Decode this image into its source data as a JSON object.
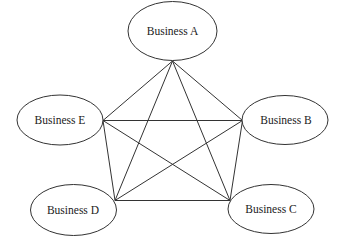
{
  "diagram": {
    "type": "network",
    "nodes": [
      {
        "id": "A",
        "label": "Business A"
      },
      {
        "id": "B",
        "label": "Business B"
      },
      {
        "id": "C",
        "label": "Business C"
      },
      {
        "id": "D",
        "label": "Business D"
      },
      {
        "id": "E",
        "label": "Business E"
      }
    ],
    "edges": [
      [
        "A",
        "E"
      ],
      [
        "A",
        "B"
      ],
      [
        "A",
        "D"
      ],
      [
        "A",
        "C"
      ],
      [
        "E",
        "B"
      ],
      [
        "E",
        "D"
      ],
      [
        "E",
        "C"
      ],
      [
        "B",
        "D"
      ],
      [
        "B",
        "C"
      ],
      [
        "D",
        "C"
      ]
    ],
    "colors": {
      "stroke": "#333333",
      "background": "#ffffff",
      "text": "#222222"
    }
  }
}
